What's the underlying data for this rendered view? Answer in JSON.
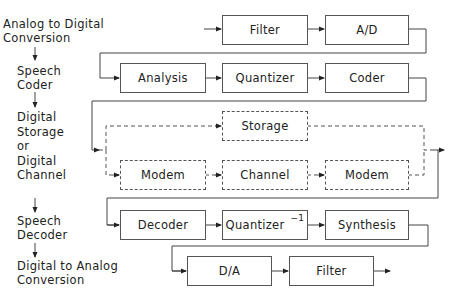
{
  "stages": [
    {
      "lines": [
        "Analog to Digital",
        "Conversion"
      ]
    },
    {
      "lines": [
        "Speech",
        "Coder"
      ]
    },
    {
      "lines": [
        "Digital",
        "Storage",
        "or",
        "Digital",
        "Channel"
      ]
    },
    {
      "lines": [
        "Speech",
        "Decoder"
      ]
    },
    {
      "lines": [
        "Digital to Analog",
        "Conversion"
      ]
    }
  ],
  "blocks": {
    "row1": [
      "Filter",
      "A/D"
    ],
    "row2": [
      "Analysis",
      "Quantizer",
      "Coder"
    ],
    "storage": "Storage",
    "row3": [
      "Modem",
      "Channel",
      "Modem"
    ],
    "row4": [
      "Decoder",
      "Quantizer",
      "Synthesis"
    ],
    "row4_superscript": "−1",
    "row5": [
      "D/A",
      "Filter"
    ]
  }
}
